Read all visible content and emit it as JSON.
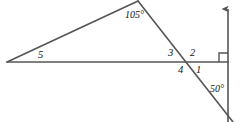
{
  "figure": {
    "kind": "geometry-diagram",
    "width": 243,
    "height": 122,
    "background_color": "#ffffff",
    "stroke_color": "#555555"
  },
  "labels": {
    "angle_105": "105°",
    "angle_50": "50°",
    "angle_1": "1",
    "angle_2": "2",
    "angle_3": "3",
    "angle_4": "4",
    "angle_5": "5"
  },
  "geometry": {
    "horizontal_ray": {
      "name": "horizontal-base-line",
      "from": [
        7,
        62
      ],
      "to": [
        228,
        62
      ]
    },
    "triangle_left_side": {
      "name": "triangle-left-side",
      "from": [
        7,
        62
      ],
      "to": [
        138,
        1
      ]
    },
    "transversal_line": {
      "name": "transversal-line",
      "from": [
        138,
        1
      ],
      "to": [
        233,
        122
      ]
    },
    "vertical_ray": {
      "name": "vertical-ray",
      "from": [
        228,
        122
      ],
      "to": [
        228,
        5
      ],
      "arrow_at": "top"
    },
    "right_angle_marker": {
      "name": "right-angle-marker",
      "corner": [
        228,
        62
      ],
      "size": 9
    },
    "intersection_point": [
      188,
      62
    ],
    "apex_point": [
      138,
      1
    ],
    "left_vertex": [
      7,
      62
    ]
  },
  "label_positions": {
    "angle_105": [
      125,
      10
    ],
    "angle_50": [
      210,
      84
    ],
    "angle_1": [
      196,
      64
    ],
    "angle_2": [
      190,
      48
    ],
    "angle_3": [
      168,
      48
    ],
    "angle_4": [
      178,
      64
    ],
    "angle_5": [
      38,
      50
    ]
  }
}
